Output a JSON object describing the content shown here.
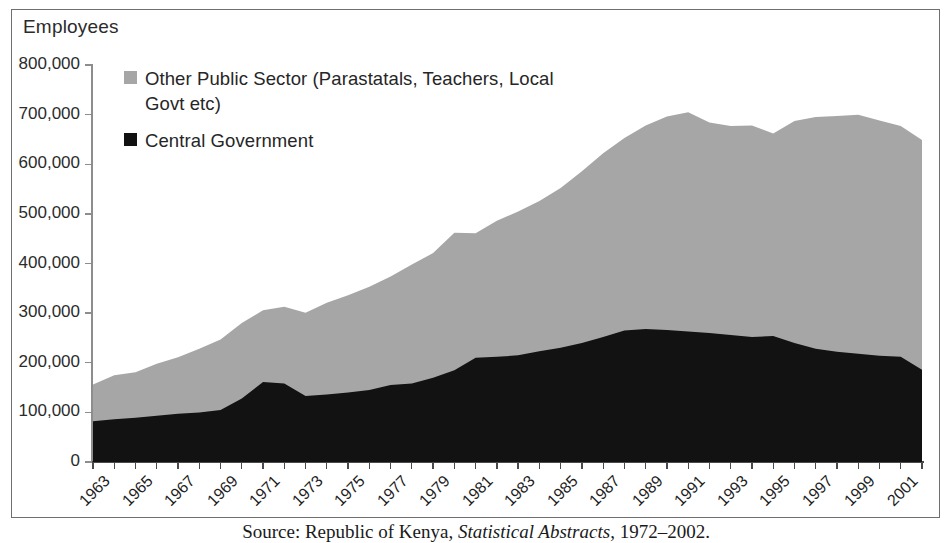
{
  "figure": {
    "axis_title_y": "Employees",
    "source_caption_prefix": "Source: Republic of Kenya, ",
    "source_caption_italic": "Statistical Abstracts",
    "source_caption_suffix": ", 1972–2002."
  },
  "legend": {
    "position": "inside-top-left",
    "items": [
      {
        "label": "Other Public Sector (Parastatals, Teachers, Local Govt etc)",
        "color": "#a6a6a6"
      },
      {
        "label": "Central Government",
        "color": "#121212"
      }
    ]
  },
  "chart_data": {
    "type": "area",
    "stacked": true,
    "title": "",
    "subtitle": "",
    "xlabel": "",
    "ylabel": "Employees",
    "ylim": [
      0,
      800000
    ],
    "xlim": [
      1963,
      2002
    ],
    "grid": false,
    "y_ticks": [
      0,
      100000,
      200000,
      300000,
      400000,
      500000,
      600000,
      700000,
      800000
    ],
    "y_tick_labels": [
      "0",
      "100,000",
      "200,000",
      "300,000",
      "400,000",
      "500,000",
      "600,000",
      "700,000",
      "800,000"
    ],
    "x_tick_labels": [
      "1963",
      "1965",
      "1967",
      "1969",
      "1971",
      "1973",
      "1975",
      "1977",
      "1979",
      "1981",
      "1983",
      "1985",
      "1987",
      "1989",
      "1991",
      "1993",
      "1995",
      "1997",
      "1999",
      "2001"
    ],
    "x": [
      1963,
      1964,
      1965,
      1966,
      1967,
      1968,
      1969,
      1970,
      1971,
      1972,
      1973,
      1974,
      1975,
      1976,
      1977,
      1978,
      1979,
      1980,
      1981,
      1982,
      1983,
      1984,
      1985,
      1986,
      1987,
      1988,
      1989,
      1990,
      1991,
      1992,
      1993,
      1994,
      1995,
      1996,
      1997,
      1998,
      1999,
      2000,
      2001,
      2002
    ],
    "series": [
      {
        "name": "Central Government",
        "color": "#121212",
        "values": [
          82000,
          86000,
          89000,
          93000,
          97000,
          100000,
          105000,
          128000,
          161000,
          158000,
          133000,
          136000,
          140000,
          145000,
          155000,
          158000,
          170000,
          185000,
          210000,
          212000,
          215000,
          223000,
          230000,
          240000,
          252000,
          265000,
          268000,
          266000,
          263000,
          260000,
          256000,
          252000,
          254000,
          240000,
          228000,
          222000,
          218000,
          214000,
          212000,
          186000
        ]
      },
      {
        "name": "Other Public Sector (Parastatals, Teachers, Local Govt etc)",
        "color": "#a6a6a6",
        "values": [
          74000,
          89000,
          92000,
          105000,
          114000,
          128000,
          142000,
          152000,
          145000,
          155000,
          168000,
          185000,
          196000,
          208000,
          219000,
          240000,
          251000,
          277000,
          251000,
          274000,
          290000,
          303000,
          322000,
          346000,
          370000,
          388000,
          410000,
          430000,
          442000,
          424000,
          421000,
          426000,
          408000,
          447000,
          467000,
          475000,
          482000,
          474000,
          465000,
          463000
        ]
      }
    ],
    "totals": [
      156000,
      175000,
      181000,
      198000,
      211000,
      228000,
      247000,
      280000,
      306000,
      313000,
      301000,
      321000,
      336000,
      353000,
      374000,
      398000,
      421000,
      462000,
      461000,
      486000,
      505000,
      526000,
      552000,
      586000,
      622000,
      653000,
      678000,
      696000,
      705000,
      684000,
      677000,
      678000,
      662000,
      687000,
      695000,
      697000,
      700000,
      688000,
      677000,
      649000
    ]
  }
}
